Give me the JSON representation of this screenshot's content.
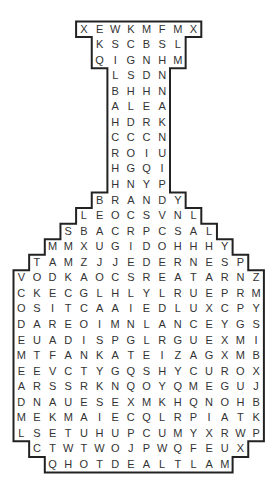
{
  "puzzle": {
    "type": "word-search",
    "shape": "bottle",
    "colors": {
      "outline": "#222222",
      "letters": "#333333",
      "background": "#ffffff"
    },
    "grid_columns": 16,
    "rows": [
      {
        "start_col": 4,
        "letters": "XEWKMFMX"
      },
      {
        "start_col": 5,
        "letters": "KSCBSL"
      },
      {
        "start_col": 5,
        "letters": "QIGNHM"
      },
      {
        "start_col": 6,
        "letters": "LSDN"
      },
      {
        "start_col": 6,
        "letters": "BHHN"
      },
      {
        "start_col": 6,
        "letters": "ALEA"
      },
      {
        "start_col": 6,
        "letters": "HDRK"
      },
      {
        "start_col": 6,
        "letters": "CCCN"
      },
      {
        "start_col": 6,
        "letters": "ROIU"
      },
      {
        "start_col": 6,
        "letters": "HGQI"
      },
      {
        "start_col": 6,
        "letters": "HNYP"
      },
      {
        "start_col": 5,
        "letters": "BRANDY"
      },
      {
        "start_col": 4,
        "letters": "LEOCSVNL"
      },
      {
        "start_col": 3,
        "letters": "SBACRPCSAL"
      },
      {
        "start_col": 2,
        "letters": "MMXUGIDOHHHY"
      },
      {
        "start_col": 1,
        "letters": "TAMZJJEDERNESP"
      },
      {
        "start_col": 0,
        "letters": "VODKAOCSREATARNZ"
      },
      {
        "start_col": 0,
        "letters": "CKECGLHLYLRUEPRM"
      },
      {
        "start_col": 0,
        "letters": "OSITCAAIEDLUXCPY"
      },
      {
        "start_col": 0,
        "letters": "DAREOIMNLANCEYGS"
      },
      {
        "start_col": 0,
        "letters": "EUADISPGLRGUEXMI"
      },
      {
        "start_col": 0,
        "letters": "MTFANKATEIZAGXMB"
      },
      {
        "start_col": 0,
        "letters": "EEVCTYGQSHYCUROX"
      },
      {
        "start_col": 0,
        "letters": "ARSSRKNQOYQMEGUJ"
      },
      {
        "start_col": 0,
        "letters": "DNAUESEXMKHQNOHB"
      },
      {
        "start_col": 0,
        "letters": "MEKMAIECQLRPIATK"
      },
      {
        "start_col": 0,
        "letters": "LSETUHUPCUMYXRWP"
      },
      {
        "start_col": 1,
        "letters": "CTWTWOJPWQFEUX"
      },
      {
        "start_col": 2,
        "letters": "QHOTDEALTLAM"
      }
    ]
  }
}
